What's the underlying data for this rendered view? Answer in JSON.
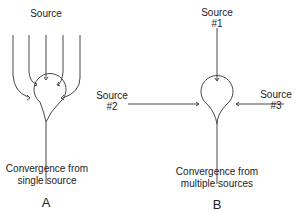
{
  "panels": [
    {
      "id": "A",
      "letter": "A",
      "source_label": "Source",
      "caption_line1": "Convergence from",
      "caption_line2": "single source",
      "input_count": 5
    },
    {
      "id": "B",
      "letter": "B",
      "sources": [
        {
          "line1": "Source",
          "line2": "#1"
        },
        {
          "line1": "Source",
          "line2": "#2"
        },
        {
          "line1": "Source",
          "line2": "#3"
        }
      ],
      "caption_line1": "Convergence from",
      "caption_line2": "multiple sources"
    }
  ]
}
